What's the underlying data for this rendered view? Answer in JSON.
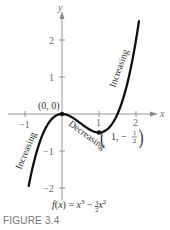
{
  "chart_data": {
    "type": "line",
    "title": "",
    "function": "f(x) = x^3 - (3/2)x^2",
    "xlabel": "x",
    "ylabel": "y",
    "xlim": [
      -1,
      2
    ],
    "ylim": [
      -2,
      2
    ],
    "x_ticks": [
      -1,
      1,
      2
    ],
    "y_ticks": [
      -2,
      -1,
      1,
      2
    ],
    "x_tick_labels": [
      "−1",
      "1",
      "2"
    ],
    "y_tick_labels": [
      "−2",
      "−1",
      "1",
      "2"
    ],
    "grid": false,
    "series": [
      {
        "name": "f(x) = x³ − (3/2)x²",
        "x": [
          -0.9,
          -0.75,
          -0.5,
          -0.25,
          0,
          0.25,
          0.5,
          0.75,
          1,
          1.25,
          1.5,
          1.75,
          2,
          2.08
        ],
        "values": [
          -1.944,
          -1.266,
          -0.5,
          -0.109,
          0,
          -0.078,
          -0.25,
          -0.422,
          -0.5,
          -0.391,
          0,
          0.766,
          2,
          2.51
        ]
      }
    ],
    "annotations": [
      {
        "text": "(0, 0)",
        "x": 0,
        "y": 0
      },
      {
        "text": "(1, −½)",
        "x": 1,
        "y": -0.5
      },
      {
        "text": "Increasing",
        "region": "x < 0"
      },
      {
        "text": "Decreasing",
        "region": "0 < x < 1"
      },
      {
        "text": "Increasing",
        "region": "x > 1"
      }
    ]
  },
  "labels": {
    "x_axis": "x",
    "y_axis": "y",
    "tick_x_neg1": "−1",
    "tick_x_1": "1",
    "tick_x_2": "2",
    "tick_y_2": "2",
    "tick_y_1": "1",
    "tick_y_neg1": "−1",
    "tick_y_neg2": "−2",
    "point_origin": "(0, 0)",
    "point_min_prefix": "1, −",
    "increasing_left": "Increasing",
    "decreasing": "Decreasing",
    "increasing_right": "Increasing"
  },
  "caption": {
    "formula_f": "f",
    "formula_x": "x",
    "formula_eq": ") = ",
    "formula_open": "(",
    "formula_minus": " − ",
    "fig_label": "FIGURE 3.4"
  }
}
